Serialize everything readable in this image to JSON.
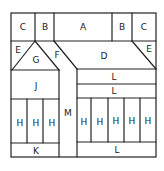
{
  "diagram": {
    "regions": [
      {
        "id": "c-left",
        "label": "C"
      },
      {
        "id": "b-left",
        "label": "B"
      },
      {
        "id": "a",
        "label": "A"
      },
      {
        "id": "b-right",
        "label": "B"
      },
      {
        "id": "c-right",
        "label": "C"
      },
      {
        "id": "e-left",
        "label": "E"
      },
      {
        "id": "g",
        "label": "G"
      },
      {
        "id": "f",
        "label": "F"
      },
      {
        "id": "d",
        "label": "D"
      },
      {
        "id": "e-right",
        "label": "E"
      },
      {
        "id": "j",
        "label": "J"
      },
      {
        "id": "m",
        "label": "M"
      },
      {
        "id": "l-top1",
        "label": "L"
      },
      {
        "id": "l-top2",
        "label": "L"
      },
      {
        "id": "h1",
        "label": "H"
      },
      {
        "id": "h2",
        "label": "H"
      },
      {
        "id": "h3",
        "label": "H"
      },
      {
        "id": "h4",
        "label": "H"
      },
      {
        "id": "h5",
        "label": "H"
      },
      {
        "id": "h6",
        "label": "H"
      },
      {
        "id": "h7",
        "label": "H"
      },
      {
        "id": "h8",
        "label": "H"
      },
      {
        "id": "k",
        "label": "K"
      },
      {
        "id": "l-bottom",
        "label": "L"
      }
    ]
  }
}
